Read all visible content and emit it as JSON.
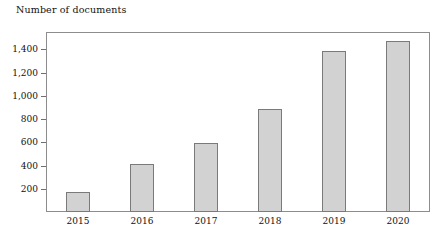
{
  "chart_data": {
    "type": "bar",
    "title": "Number of documents",
    "xlabel": "",
    "ylabel": "Number of documents",
    "categories": [
      "2015",
      "2016",
      "2017",
      "2018",
      "2019",
      "2020"
    ],
    "values": [
      170,
      410,
      590,
      890,
      1390,
      1470
    ],
    "series": [
      {
        "name": "Number of documents",
        "values": [
          170,
          410,
          590,
          890,
          1390,
          1470
        ]
      }
    ],
    "ylim": [
      0,
      1550
    ],
    "yticks": [
      200,
      400,
      600,
      800,
      1000,
      1200,
      1400
    ],
    "ytick_labels": [
      "200",
      "400",
      "600",
      "800",
      "1,000",
      "1,200",
      "1,400"
    ],
    "grid": false,
    "legend": false,
    "legend_position": "none",
    "bar_fill_color": "#d2d2d2",
    "bar_border_color": "#7a7a7a",
    "axis_color": "#8d8d8d"
  }
}
